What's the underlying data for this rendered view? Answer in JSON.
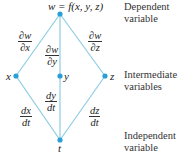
{
  "diagram": {
    "colors": {
      "edge": "#8ecde3",
      "node": "#2a9fd6"
    },
    "nodes": {
      "top": {
        "label": "w = f(x, y, z)",
        "x": 60,
        "y": 14
      },
      "x": {
        "label": "x",
        "x": 16,
        "y": 76
      },
      "y": {
        "label": "y",
        "x": 60,
        "y": 76
      },
      "z": {
        "label": "z",
        "x": 105,
        "y": 76
      },
      "t": {
        "label": "t",
        "x": 60,
        "y": 140
      }
    },
    "edges": {
      "top_x": {
        "num": "∂w",
        "den": "∂x"
      },
      "top_y": {
        "num": "∂w",
        "den": "∂y"
      },
      "top_z": {
        "num": "∂w",
        "den": "∂z"
      },
      "x_t": {
        "num": "dx",
        "den": "dt"
      },
      "y_t": {
        "num": "dy",
        "den": "dt"
      },
      "z_t": {
        "num": "dz",
        "den": "dt"
      }
    },
    "side_labels": {
      "dependent": {
        "line1": "Dependent",
        "line2": "variable"
      },
      "intermediate": {
        "line1": "Intermediate",
        "line2": "variables"
      },
      "independent": {
        "line1": "Independent",
        "line2": "variable"
      }
    }
  }
}
